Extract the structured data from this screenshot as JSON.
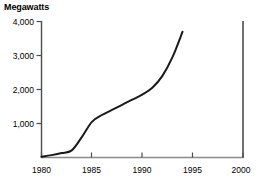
{
  "chart_data": {
    "type": "line",
    "title": "Megawatts",
    "xlabel": "",
    "ylabel": "Megawatts",
    "xlim": [
      1980,
      2000
    ],
    "ylim": [
      0,
      4000
    ],
    "grid": false,
    "legend": null,
    "x_ticks": [
      "1980",
      "1985",
      "1990",
      "1995",
      "2000"
    ],
    "x_tick_values": [
      1980,
      1985,
      1990,
      1995,
      2000
    ],
    "y_ticks": [
      "1,000",
      "2,000",
      "3,000",
      "4,000"
    ],
    "y_tick_values": [
      1000,
      2000,
      3000,
      4000
    ],
    "series": [
      {
        "name": "Megawatts",
        "color": "#1a1a1a",
        "x": [
          1980,
          1981,
          1982,
          1983,
          1984,
          1985,
          1986,
          1987,
          1988,
          1989,
          1990,
          1991,
          1992,
          1993,
          1994
        ],
        "values": [
          20,
          70,
          130,
          210,
          600,
          1050,
          1250,
          1400,
          1550,
          1700,
          1850,
          2050,
          2400,
          2950,
          3700
        ]
      }
    ]
  },
  "axis": {
    "y_axis_color": "#4d4d4d",
    "x_axis_color": "#808080",
    "right_axis_color": "#4d4d4d",
    "tick_color": "#4d4d4d"
  }
}
